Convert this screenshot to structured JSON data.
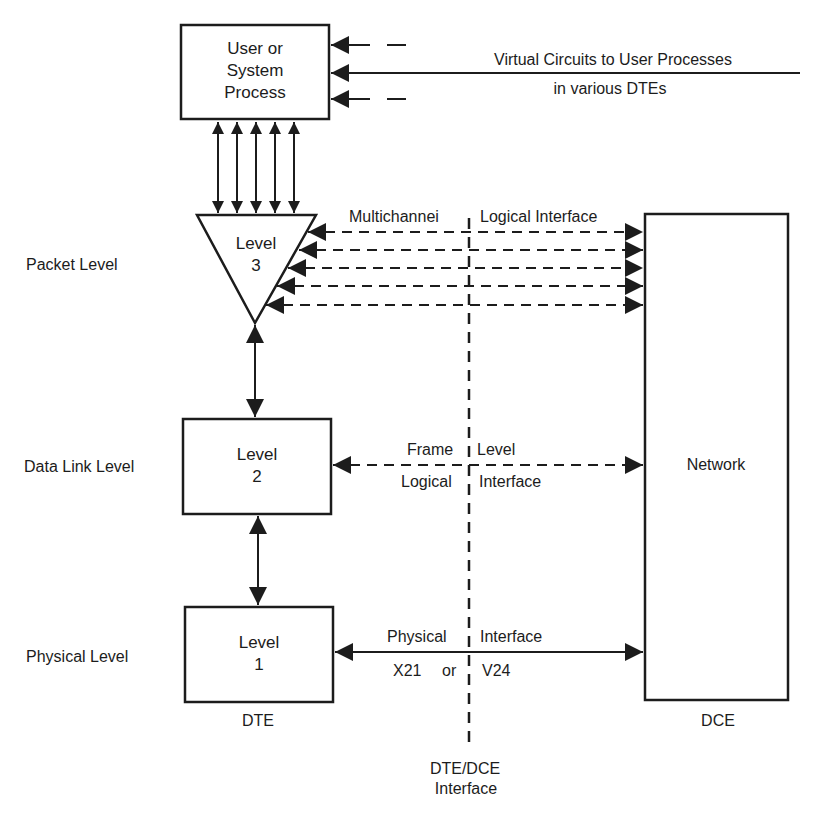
{
  "diagram": {
    "type": "x25-layered-architecture",
    "colors": {
      "ink": "#1c1c1c",
      "background": "#ffffff"
    },
    "top_box": {
      "line1": "User or",
      "line2": "System",
      "line3": "Process"
    },
    "virtual_circuits": {
      "line1": "Virtual Circuits to User Processes",
      "line2": "in various DTEs"
    },
    "level3": {
      "line1": "Level",
      "line2": "3"
    },
    "level2": {
      "line1": "Level",
      "line2": "2"
    },
    "level1": {
      "line1": "Level",
      "line2": "1"
    },
    "network": {
      "label": "Network"
    },
    "left_labels": {
      "packet": "Packet Level",
      "data_link": "Data Link Level",
      "physical": "Physical Level"
    },
    "interfaces": {
      "multichannel_left": "Multichannei",
      "multichannel_right": "Logical Interface",
      "frame_top_left": "Frame",
      "frame_top_right": "Level",
      "frame_bottom_left": "Logical",
      "frame_bottom_right": "Interface",
      "physical_top_left": "Physical",
      "physical_top_right": "Interface",
      "physical_bottom_left": "X21",
      "physical_bottom_or": "or",
      "physical_bottom_right": "V24"
    },
    "bottom_labels": {
      "dte": "DTE",
      "dce": "DCE",
      "dte_dce_line1": "DTE/DCE",
      "dte_dce_line2": "Interface"
    }
  }
}
